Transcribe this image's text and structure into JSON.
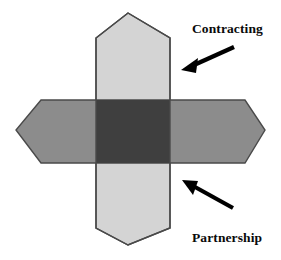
{
  "figure": {
    "type": "overlapping-hexagon-cross-diagram",
    "background_color": "#ffffff",
    "outline_color": "#4a4a4a"
  },
  "shapes": {
    "vertical_band": {
      "name": "vertical-hexagon",
      "fill_color": "#d4d4d4",
      "points": "96,38 128,13 170,38 170,228 128,245 96,228"
    },
    "horizontal_band": {
      "name": "horizontal-hexagon",
      "fill_color": "#8c8c8c",
      "points": "41,100 16,130 41,163 245,163 265,130 245,100"
    },
    "overlap": {
      "name": "overlap-region",
      "fill_color": "#3f3f3f",
      "points": "96,100 170,100 170,163 96,163"
    }
  },
  "arrows": [
    {
      "name": "contracting-arrow",
      "color": "#000000",
      "tail_x": 234,
      "tail_y": 47,
      "tip_x": 182,
      "tip_y": 70,
      "direction": "down-left"
    },
    {
      "name": "partnership-arrow",
      "color": "#000000",
      "tail_x": 233,
      "tail_y": 208,
      "tip_x": 182,
      "tip_y": 180,
      "direction": "up-left"
    }
  ],
  "labels": {
    "contracting": "Contracting",
    "partnership": "Partnership"
  }
}
